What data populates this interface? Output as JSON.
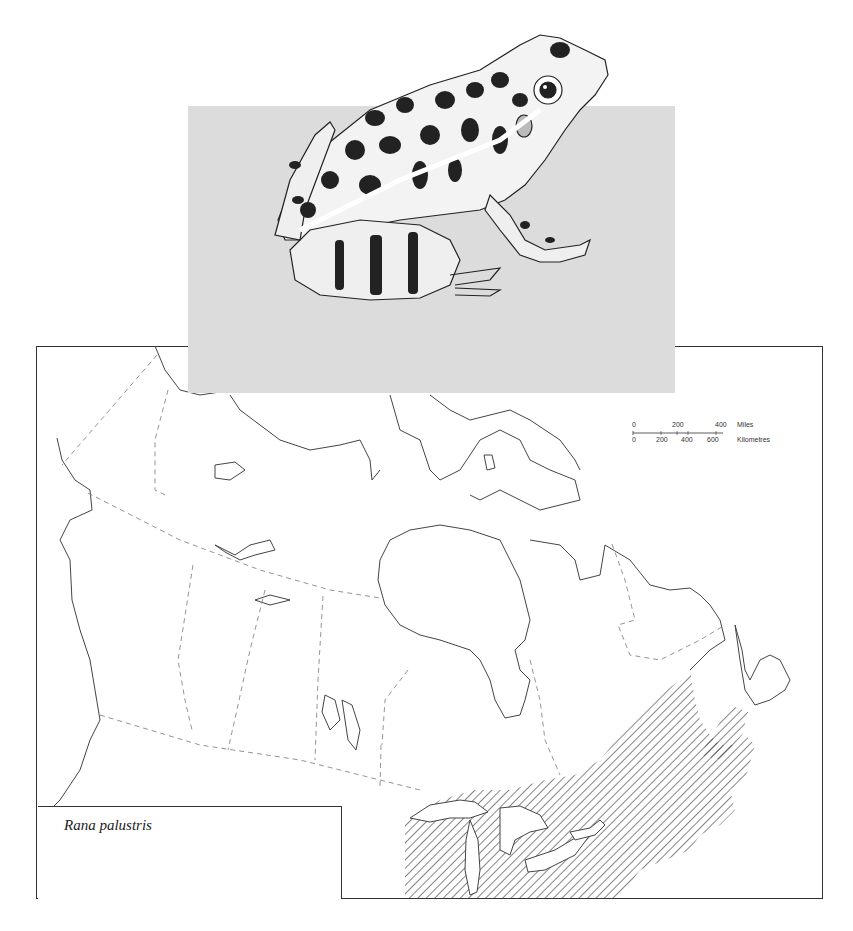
{
  "figure": {
    "species_name": "Rana palustris",
    "illustration": "pickerel-frog-illustration",
    "map_region": "Canada and northeastern United States",
    "range_pattern": "diagonal-hatching",
    "colors": {
      "panel_grey": "#dcdcdc",
      "line": "#333333",
      "boundary_dashed": "#777777",
      "background": "#ffffff"
    }
  },
  "scale_bar": {
    "miles_label": "Miles",
    "km_label": "Kilometres",
    "miles_ticks": [
      "0",
      "200",
      "400"
    ],
    "km_ticks": [
      "0",
      "200",
      "400",
      "600"
    ]
  }
}
